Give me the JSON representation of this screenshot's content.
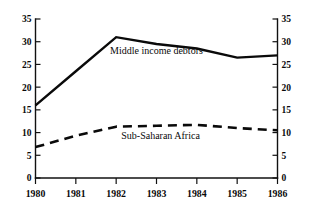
{
  "chart_data": {
    "type": "line",
    "title": "",
    "xlabel": "",
    "ylabel": "",
    "x": [
      1980,
      1981,
      1982,
      1983,
      1984,
      1985,
      1986
    ],
    "categories": [
      "1980",
      "1981",
      "1982",
      "1983",
      "1984",
      "1985",
      "1986"
    ],
    "xlim": [
      1980,
      1986
    ],
    "ylim": [
      0,
      35
    ],
    "grid": false,
    "legend_position": "inline-annotation",
    "y_ticks": [
      0,
      5,
      10,
      15,
      20,
      25,
      30,
      35
    ],
    "y_tick_labels": [
      "0",
      "5",
      "10",
      "15",
      "20",
      "25",
      "30",
      "35"
    ],
    "left_axis_labels": [
      "35",
      "30",
      "25",
      "20",
      "15",
      "10",
      "5",
      "0"
    ],
    "right_axis_labels": [
      "35",
      "30",
      "25",
      "20",
      "15",
      "10",
      "5",
      "0"
    ],
    "series": [
      {
        "name": "Middle income debtors",
        "style": "solid",
        "color": "#0a0a0a",
        "values": [
          16,
          23.5,
          31,
          29.5,
          28.5,
          26.5,
          27
        ]
      },
      {
        "name": "Sub-Saharan Africa",
        "style": "dashed",
        "color": "#0a0a0a",
        "values": [
          6.8,
          9.3,
          11.3,
          11.5,
          11.7,
          11,
          10.5
        ]
      }
    ],
    "annotations": [
      {
        "text": "Middle income debtors",
        "x": 1983.0,
        "y": 27.2
      },
      {
        "text": "Sub-Saharan Africa",
        "x": 1983.1,
        "y": 8.6
      }
    ]
  }
}
